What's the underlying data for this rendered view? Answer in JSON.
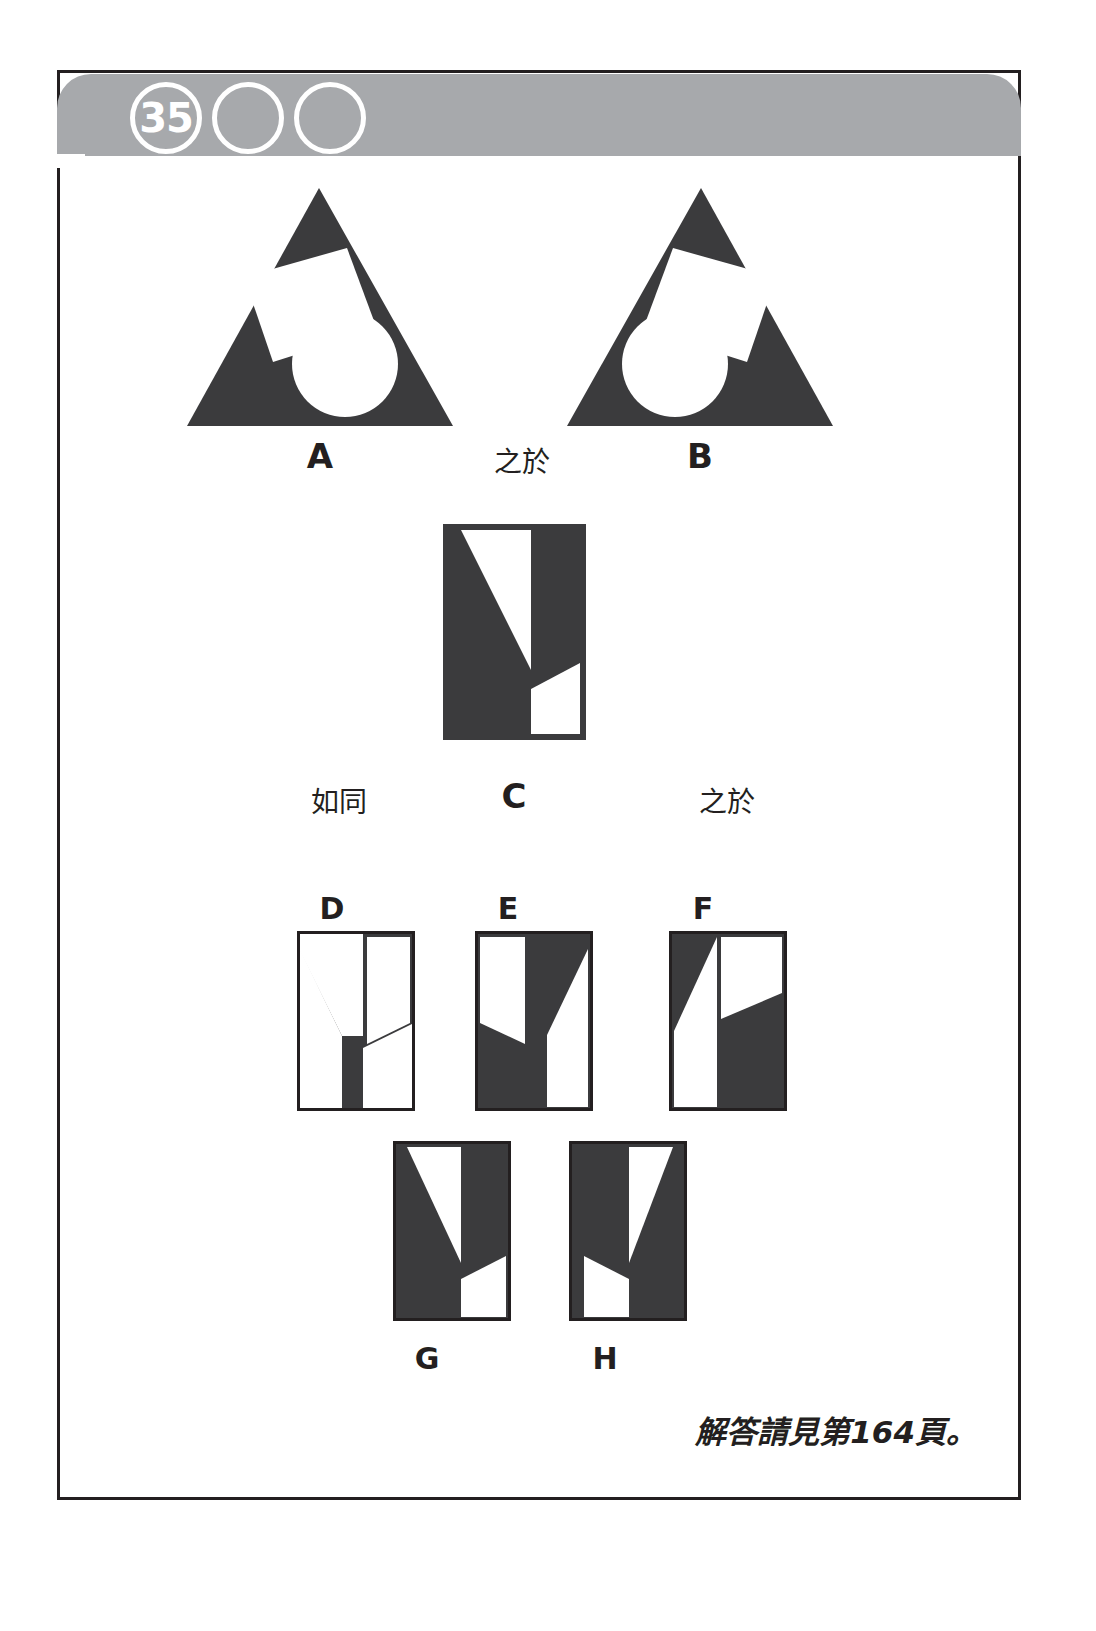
{
  "header": {
    "puzzle_number": "35",
    "circles": [
      "35",
      "",
      ""
    ],
    "band_color": "#a7a9ac",
    "circle_stroke": "#ffffff"
  },
  "colors": {
    "ink": "#231f20",
    "paper": "#ffffff",
    "band": "#a7a9ac"
  },
  "connectors": {
    "is_to_1": "之於",
    "as": "如同",
    "is_to_2": "之於"
  },
  "figures": {
    "A": {
      "label": "A",
      "shape": "triangle",
      "description": "dark triangle containing a tilted white square upper-left-of-centre and a white circle lower-right"
    },
    "B": {
      "label": "B",
      "shape": "triangle",
      "description": "dark triangle containing a tilted white square upper-right-of-centre and a white circle lower-left"
    },
    "C": {
      "label": "C",
      "shape": "rectangle",
      "description": "dark upright rectangle with a white triangle in the upper portion and a white quadrilateral lower-right"
    }
  },
  "options": [
    {
      "label": "D"
    },
    {
      "label": "E"
    },
    {
      "label": "F"
    },
    {
      "label": "G"
    },
    {
      "label": "H"
    }
  ],
  "footer": {
    "answer_note": "解答請見第164頁。"
  }
}
